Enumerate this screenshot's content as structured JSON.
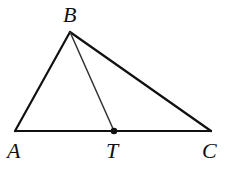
{
  "diagram": {
    "type": "triangle",
    "points": {
      "A": {
        "label": "A",
        "x": 15,
        "y": 131
      },
      "B": {
        "label": "B",
        "x": 70,
        "y": 32
      },
      "C": {
        "label": "C",
        "x": 211,
        "y": 131
      },
      "T": {
        "label": "T",
        "x": 114,
        "y": 131
      }
    },
    "segments": [
      "AB",
      "BC",
      "AC",
      "BT"
    ],
    "marked_point": "T",
    "colors": {
      "stroke": "#111111",
      "background": "#ffffff"
    }
  }
}
